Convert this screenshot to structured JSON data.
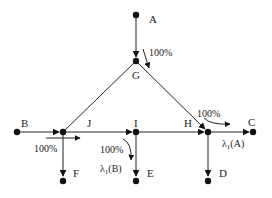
{
  "diagram": {
    "title": "",
    "nodes": [
      {
        "id": "A",
        "label": "A",
        "x": 136,
        "y": 15
      },
      {
        "id": "G",
        "label": "G",
        "x": 136,
        "y": 61
      },
      {
        "id": "B",
        "label": "B",
        "x": 17,
        "y": 132
      },
      {
        "id": "J",
        "label": "J",
        "x": 63,
        "y": 132
      },
      {
        "id": "I",
        "label": "I",
        "x": 136,
        "y": 132
      },
      {
        "id": "H",
        "label": "H",
        "x": 208,
        "y": 132
      },
      {
        "id": "C",
        "label": "C",
        "x": 253,
        "y": 132
      },
      {
        "id": "F",
        "label": "F",
        "x": 63,
        "y": 180
      },
      {
        "id": "E",
        "label": "E",
        "x": 136,
        "y": 180
      },
      {
        "id": "D",
        "label": "D",
        "x": 208,
        "y": 180
      }
    ],
    "edges": [
      {
        "from": "A",
        "to": "G",
        "directed": true
      },
      {
        "from": "G",
        "to": "J",
        "directed": false
      },
      {
        "from": "G",
        "to": "H",
        "directed": true
      },
      {
        "from": "B",
        "to": "J",
        "directed": true
      },
      {
        "from": "J",
        "to": "I",
        "directed": true
      },
      {
        "from": "I",
        "to": "H",
        "directed": true
      },
      {
        "from": "H",
        "to": "C",
        "directed": true
      },
      {
        "from": "J",
        "to": "F",
        "directed": true
      },
      {
        "from": "I",
        "to": "E",
        "directed": true
      },
      {
        "from": "H",
        "to": "D",
        "directed": true
      }
    ],
    "annotations": {
      "a_to_g_pct": "100%",
      "b_to_j_pct": "100%",
      "i_turn_pct": "100%",
      "h_turn_pct": "100%",
      "lambda_b": "λ1(B)",
      "lambda_a": "λ1(A)"
    },
    "labels": {
      "A": "A",
      "G": "G",
      "B": "B",
      "J": "J",
      "I": "I",
      "H": "H",
      "C": "C",
      "F": "F",
      "E": "E",
      "D": "D"
    },
    "lambda": {
      "symbol": "λ",
      "sub": "1",
      "a_arg": "(A)",
      "b_arg": "(B)"
    }
  }
}
